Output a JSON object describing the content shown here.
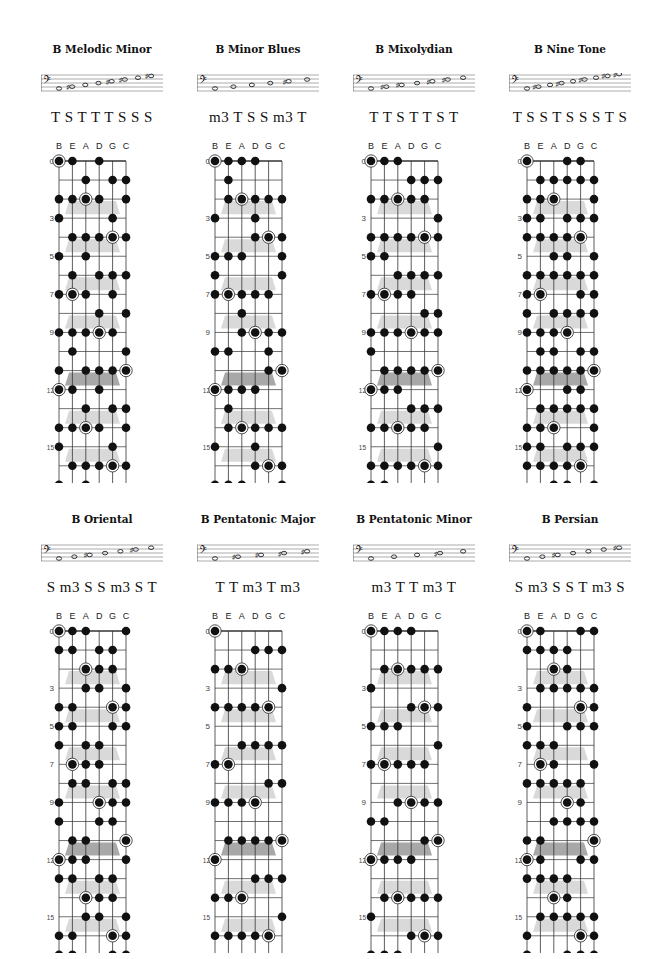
{
  "page": {
    "tuning": [
      "B",
      "E",
      "A",
      "D",
      "G",
      "C"
    ],
    "tuning_semitones": [
      11,
      4,
      9,
      2,
      7,
      0
    ],
    "root": "B",
    "root_semitone": 11,
    "fret_markers": [
      "0",
      "3",
      "5",
      "7",
      "9",
      "12",
      "15",
      "17"
    ],
    "colors": {
      "dot": "#111111",
      "grid": "#333333",
      "shade": "#cccccc",
      "shade_dark": "#999999",
      "label": "#444444"
    }
  },
  "scales": [
    {
      "name": "B Melodic Minor",
      "steps": "T S T T T S S S",
      "intervals": [
        0,
        2,
        3,
        5,
        7,
        9,
        11
      ],
      "staff_notes": [
        "o",
        "#o",
        "o",
        "o",
        "#o",
        "#o",
        "o",
        "#o"
      ]
    },
    {
      "name": "B Minor Blues",
      "steps": "m3 T S S m3 T",
      "intervals": [
        0,
        3,
        5,
        6,
        7,
        10
      ],
      "staff_notes": [
        "o",
        "o",
        "o",
        "o",
        "#o",
        "o"
      ]
    },
    {
      "name": "B Mixolydian",
      "steps": "T T S T T S T",
      "intervals": [
        0,
        2,
        4,
        5,
        7,
        9,
        10
      ],
      "staff_notes": [
        "o",
        "#o",
        "#o",
        "o",
        "#o",
        "#o",
        "o"
      ]
    },
    {
      "name": "B Nine Tone",
      "steps": "T S S T S S S T S",
      "intervals": [
        0,
        2,
        3,
        4,
        6,
        7,
        8,
        9,
        11
      ],
      "staff_notes": [
        "o",
        "#o",
        "o",
        "#o",
        "o",
        "#o",
        "o",
        "#o",
        "#o"
      ]
    },
    {
      "name": "B Oriental",
      "steps": "S m3 S S m3 S T",
      "intervals": [
        0,
        1,
        4,
        5,
        6,
        9,
        10
      ],
      "staff_notes": [
        "o",
        "o",
        "#o",
        "o",
        "o",
        "#o",
        "o"
      ]
    },
    {
      "name": "B Pentatonic Major",
      "steps": "T T m3 T m3",
      "intervals": [
        0,
        2,
        4,
        7,
        9
      ],
      "staff_notes": [
        "o",
        "#o",
        "#o",
        "#o",
        "#o"
      ]
    },
    {
      "name": "B Pentatonic Minor",
      "steps": "m3 T T m3 T",
      "intervals": [
        0,
        3,
        5,
        7,
        10
      ],
      "staff_notes": [
        "o",
        "o",
        "o",
        "#o",
        "o"
      ]
    },
    {
      "name": "B Persian",
      "steps": "S m3 S S T m3 S",
      "intervals": [
        0,
        1,
        4,
        5,
        6,
        8,
        11
      ],
      "staff_notes": [
        "o",
        "o",
        "#o",
        "o",
        "o",
        "o",
        "#o"
      ]
    }
  ]
}
